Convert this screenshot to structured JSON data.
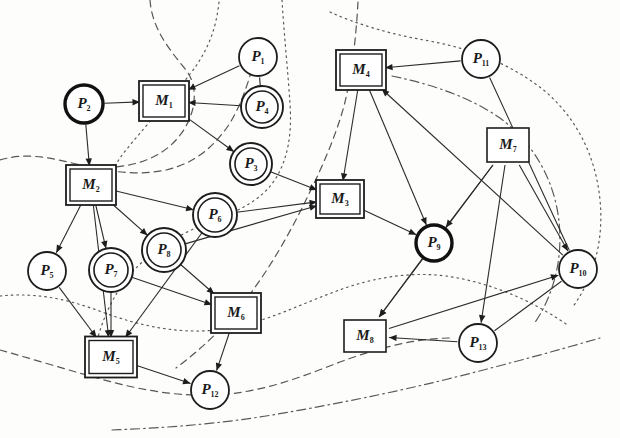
{
  "figure": {
    "kind": "bipartite-graph",
    "width": 620,
    "height": 438,
    "background_color": "#fdfdfb",
    "ink_color": "#1d1d1d"
  },
  "legend": {
    "machine_shape": "square",
    "place_shape": "circle",
    "double_border_meaning": "double-outlined node",
    "bold_border_meaning": "bold-outlined node"
  },
  "nodes": [
    {
      "id": "P1",
      "label": "P",
      "sub": "1",
      "type": "place",
      "style": "single",
      "cx": 258,
      "cy": 57,
      "r": 19
    },
    {
      "id": "P2",
      "label": "P",
      "sub": "2",
      "type": "place",
      "style": "bold",
      "cx": 84,
      "cy": 104,
      "r": 19
    },
    {
      "id": "P3",
      "label": "P",
      "sub": "3",
      "type": "place",
      "style": "double",
      "cx": 251,
      "cy": 164,
      "r": 17
    },
    {
      "id": "P4",
      "label": "P",
      "sub": "4",
      "type": "place",
      "style": "double",
      "cx": 262,
      "cy": 107,
      "r": 17
    },
    {
      "id": "P5",
      "label": "P",
      "sub": "5",
      "type": "place",
      "style": "single",
      "cx": 47,
      "cy": 271,
      "r": 19
    },
    {
      "id": "P6",
      "label": "P",
      "sub": "6",
      "type": "place",
      "style": "double",
      "cx": 215,
      "cy": 215,
      "r": 18
    },
    {
      "id": "P7",
      "label": "P",
      "sub": "7",
      "type": "place",
      "style": "double",
      "cx": 111,
      "cy": 270,
      "r": 18
    },
    {
      "id": "P8",
      "label": "P",
      "sub": "8",
      "type": "place",
      "style": "double",
      "cx": 164,
      "cy": 250,
      "r": 18
    },
    {
      "id": "P9",
      "label": "P",
      "sub": "9",
      "type": "place",
      "style": "bold",
      "cx": 434,
      "cy": 243,
      "r": 18
    },
    {
      "id": "P10",
      "label": "P",
      "sub": "10",
      "type": "place",
      "style": "single",
      "cx": 578,
      "cy": 269,
      "r": 19
    },
    {
      "id": "P11",
      "label": "P",
      "sub": "11",
      "type": "place",
      "style": "single",
      "cx": 481,
      "cy": 59,
      "r": 19
    },
    {
      "id": "P12",
      "label": "P",
      "sub": "12",
      "type": "place",
      "style": "single",
      "cx": 210,
      "cy": 390,
      "r": 19
    },
    {
      "id": "P13",
      "label": "P",
      "sub": "13",
      "type": "place",
      "style": "single",
      "cx": 478,
      "cy": 343,
      "r": 19
    },
    {
      "id": "M1",
      "label": "M",
      "sub": "1",
      "type": "machine",
      "style": "double",
      "cx": 164,
      "cy": 101,
      "w": 42,
      "h": 32
    },
    {
      "id": "M2",
      "label": "M",
      "sub": "2",
      "type": "machine",
      "style": "double",
      "cx": 91,
      "cy": 185,
      "w": 42,
      "h": 32
    },
    {
      "id": "M3",
      "label": "M",
      "sub": "3",
      "type": "machine",
      "style": "double",
      "cx": 340,
      "cy": 199,
      "w": 40,
      "h": 30
    },
    {
      "id": "M4",
      "label": "M",
      "sub": "4",
      "type": "machine",
      "style": "double",
      "cx": 361,
      "cy": 70,
      "w": 42,
      "h": 32
    },
    {
      "id": "M5",
      "label": "M",
      "sub": "5",
      "type": "machine",
      "style": "double",
      "cx": 111,
      "cy": 357,
      "w": 44,
      "h": 33
    },
    {
      "id": "M6",
      "label": "M",
      "sub": "6",
      "type": "machine",
      "style": "double",
      "cx": 236,
      "cy": 313,
      "w": 42,
      "h": 32
    },
    {
      "id": "M7",
      "label": "M",
      "sub": "7",
      "type": "machine",
      "style": "single",
      "cx": 508,
      "cy": 145,
      "w": 42,
      "h": 34
    },
    {
      "id": "M8",
      "label": "M",
      "sub": "8",
      "type": "machine",
      "style": "single",
      "cx": 365,
      "cy": 336,
      "w": 42,
      "h": 32
    }
  ],
  "edges": [
    {
      "from": "P2",
      "to": "M1",
      "arrow": "to"
    },
    {
      "from": "P2",
      "to": "M2",
      "arrow": "to"
    },
    {
      "from": "P1",
      "to": "M1",
      "arrow": "to"
    },
    {
      "from": "P4",
      "to": "M1",
      "arrow": "to"
    },
    {
      "from": "M1",
      "to": "P3",
      "arrow": "to"
    },
    {
      "from": "P4",
      "to": "P1",
      "arrow": "none"
    },
    {
      "from": "M2",
      "to": "P6",
      "arrow": "to"
    },
    {
      "from": "M2",
      "to": "P8",
      "arrow": "to"
    },
    {
      "from": "M2",
      "to": "P5",
      "arrow": "to"
    },
    {
      "from": "M2",
      "to": "P7",
      "arrow": "to"
    },
    {
      "from": "M2",
      "to": "M5",
      "arrow": "to"
    },
    {
      "from": "P3",
      "to": "M3",
      "arrow": "to"
    },
    {
      "from": "P6",
      "to": "M3",
      "arrow": "to"
    },
    {
      "from": "P8",
      "to": "M3",
      "arrow": "to"
    },
    {
      "from": "M3",
      "to": "P9",
      "arrow": "to"
    },
    {
      "from": "M4",
      "to": "M3",
      "arrow": "to"
    },
    {
      "from": "P11",
      "to": "M4",
      "arrow": "to"
    },
    {
      "from": "M4",
      "to": "P9",
      "arrow": "to"
    },
    {
      "from": "M7",
      "to": "P9",
      "arrow": "to"
    },
    {
      "from": "M7",
      "to": "P10",
      "arrow": "to"
    },
    {
      "from": "M7",
      "to": "M8",
      "arrow": "to"
    },
    {
      "from": "M7",
      "to": "P13",
      "arrow": "to"
    },
    {
      "from": "P9",
      "to": "M8",
      "arrow": "to"
    },
    {
      "from": "M8",
      "to": "P10",
      "arrow": "to"
    },
    {
      "from": "P13",
      "to": "M8",
      "arrow": "to"
    },
    {
      "from": "P13",
      "to": "P10",
      "arrow": "none"
    },
    {
      "from": "P5",
      "to": "M5",
      "arrow": "to"
    },
    {
      "from": "P7",
      "to": "M5",
      "arrow": "to"
    },
    {
      "from": "P6",
      "to": "M5",
      "arrow": "to"
    },
    {
      "from": "P8",
      "to": "M6",
      "arrow": "to"
    },
    {
      "from": "P7",
      "to": "M6",
      "arrow": "to"
    },
    {
      "from": "M6",
      "to": "P12",
      "arrow": "to"
    },
    {
      "from": "M5",
      "to": "P12",
      "arrow": "to"
    },
    {
      "from": "P10",
      "to": "M4",
      "arrow": "to"
    },
    {
      "from": "P10",
      "to": "P11",
      "arrow": "none"
    }
  ],
  "partition_curves": [
    {
      "id": "cut-1",
      "style": "dashed"
    },
    {
      "id": "cut-2",
      "style": "dotted"
    },
    {
      "id": "cut-3",
      "style": "dashed"
    },
    {
      "id": "cut-4",
      "style": "dotted"
    },
    {
      "id": "cut-5",
      "style": "dashed"
    },
    {
      "id": "cut-6",
      "style": "dotted"
    },
    {
      "id": "cut-7",
      "style": "dash-dot"
    },
    {
      "id": "cut-8",
      "style": "dotted"
    },
    {
      "id": "cut-9",
      "style": "dashed"
    },
    {
      "id": "cut-10",
      "style": "dash-dot"
    }
  ]
}
